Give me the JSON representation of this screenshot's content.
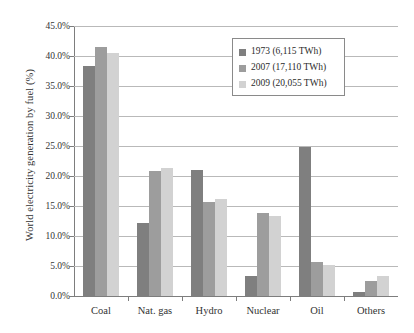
{
  "chart_data": {
    "type": "bar",
    "title": "",
    "xlabel": "",
    "ylabel": "World electricity generation by fuel (%)",
    "categories": [
      "Coal",
      "Nat. gas",
      "Hydro",
      "Nuclear",
      "Oil",
      "Others"
    ],
    "series": [
      {
        "name": "1973 (6,115 TWh)",
        "color": "#7f7f7f",
        "values": [
          38.3,
          12.1,
          21.0,
          3.3,
          24.8,
          0.6
        ]
      },
      {
        "name": "2007 (17,110 TWh)",
        "color": "#9d9d9d",
        "values": [
          41.5,
          20.8,
          15.6,
          13.8,
          5.6,
          2.5
        ]
      },
      {
        "name": "2009 (20,055 TWh)",
        "color": "#d2d2d2",
        "values": [
          40.5,
          21.3,
          16.2,
          13.3,
          5.1,
          3.3
        ]
      }
    ],
    "ylim": [
      0,
      45
    ],
    "ytick_step": 5,
    "ytick_labels": [
      "0.0%",
      "5.0%",
      "10.0%",
      "15.0%",
      "20.0%",
      "25.0%",
      "30.0%",
      "35.0%",
      "40.0%",
      "45.0%"
    ],
    "ytick_values": [
      0,
      5,
      10,
      15,
      20,
      25,
      30,
      35,
      40,
      45
    ],
    "grid": true,
    "legend_position": "upper-right"
  }
}
